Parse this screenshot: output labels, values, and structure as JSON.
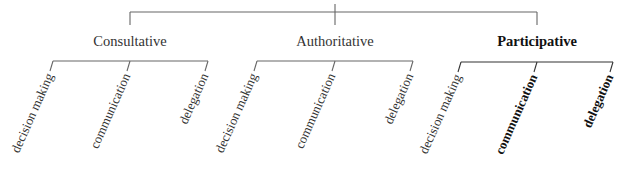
{
  "diagram": {
    "title": "",
    "root_visible": false,
    "groups": [
      {
        "label": "Consultative",
        "emphasized": false,
        "x": 130,
        "children": [
          {
            "label": "decision making",
            "x": 53,
            "emphasized": false
          },
          {
            "label": "communication",
            "x": 130,
            "emphasized": false
          },
          {
            "label": "delegation",
            "x": 208,
            "emphasized": false
          }
        ]
      },
      {
        "label": "Authoritative",
        "emphasized": false,
        "x": 335,
        "children": [
          {
            "label": "decision making",
            "x": 257,
            "emphasized": false
          },
          {
            "label": "communication",
            "x": 335,
            "emphasized": false
          },
          {
            "label": "delegation",
            "x": 413,
            "emphasized": false
          }
        ]
      },
      {
        "label": "Participative",
        "emphasized": true,
        "x": 537,
        "children": [
          {
            "label": "decision making",
            "x": 461,
            "emphasized": false
          },
          {
            "label": "communication",
            "x": 537,
            "emphasized": true
          },
          {
            "label": "delegation",
            "x": 613,
            "emphasized": true
          }
        ]
      }
    ]
  }
}
